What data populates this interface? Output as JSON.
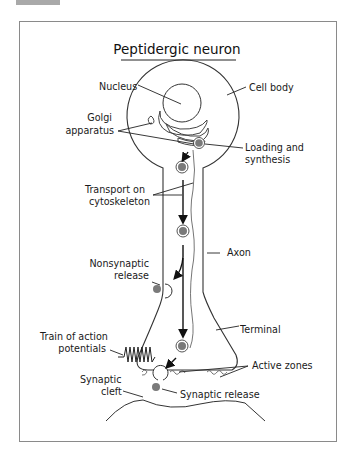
{
  "diagram": {
    "title": "Peptidergic neuron",
    "labels": {
      "nucleus": "Nucleus",
      "cell_body": "Cell body",
      "golgi_1": "Golgi",
      "golgi_2": "apparatus",
      "loading_1": "Loading and",
      "loading_2": "synthesis",
      "transport_1": "Transport on",
      "transport_2": "cytoskeleton",
      "axon": "Axon",
      "nonsynaptic_1": "Nonsynaptic",
      "nonsynaptic_2": "release",
      "train_1": "Train of action",
      "train_2": "potentials",
      "terminal": "Terminal",
      "active_zones": "Active zones",
      "cleft_1": "Synaptic",
      "cleft_2": "cleft",
      "synaptic_release": "Synaptic release"
    },
    "colors": {
      "line": "#1a1a1a",
      "vesicle_fill": "#7a7a7a",
      "frame": "#8a8a8a",
      "tab": "#a9a9a9"
    }
  }
}
